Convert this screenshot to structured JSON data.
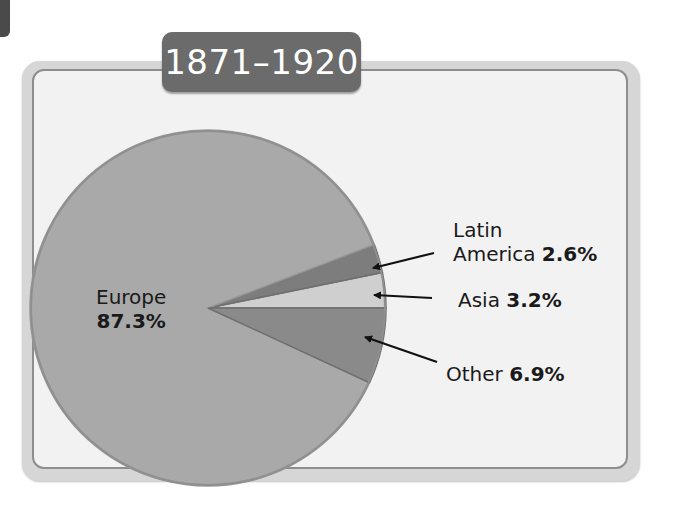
{
  "title": "1871–1920",
  "colors": {
    "europe": "#a9a9a9",
    "latin_america": "#7d7d7d",
    "asia": "#cfcfcf",
    "other": "#8a8a8a",
    "title_bg": "#6b6b6b",
    "frame_bg": "#f2f2f2"
  },
  "labels": {
    "europe": {
      "name": "Europe",
      "value": "87.3%"
    },
    "latin_america": {
      "name_line1": "Latin",
      "name_line2": "America",
      "value": "2.6%"
    },
    "asia": {
      "name": "Asia",
      "value": "3.2%"
    },
    "other": {
      "name": "Other",
      "value": "6.9%"
    }
  },
  "chart_data": {
    "type": "pie",
    "title": "1871–1920",
    "categories": [
      "Europe",
      "Latin America",
      "Asia",
      "Other"
    ],
    "values": [
      87.3,
      2.6,
      3.2,
      6.9
    ],
    "unit": "%",
    "legend": "none (callout labels with arrows)",
    "colors": [
      "#a9a9a9",
      "#7d7d7d",
      "#cfcfcf",
      "#8a8a8a"
    ]
  }
}
